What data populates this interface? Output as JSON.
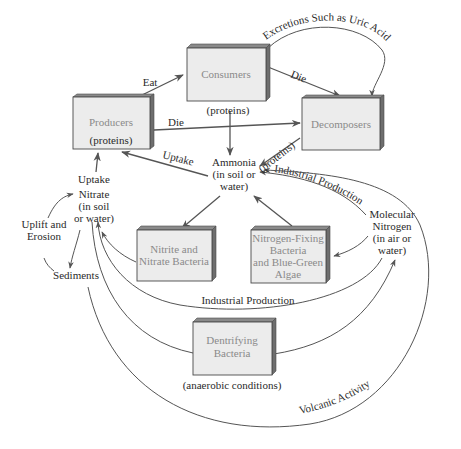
{
  "diagram": {
    "nodes": {
      "producers": {
        "label": "Producers",
        "sublabel": "(proteins)"
      },
      "consumers": {
        "label": "Consumers",
        "sublabel": "(proteins)"
      },
      "decomposers": {
        "label": "Decomposers"
      },
      "nitrite_bacteria": {
        "line1": "Nitrite and",
        "line2": "Nitrate Bacteria"
      },
      "nitrogen_fixing": {
        "line1": "Nitrogen-Fixing",
        "line2": "Bacteria",
        "line3": "and Blue-Green",
        "line4": "Algae"
      },
      "dentrifying": {
        "line1": "Dentrifying",
        "line2": "Bacteria",
        "sublabel": "(anaerobic conditions)"
      },
      "ammonia": {
        "line1": "Ammonia",
        "line2": "(in soil or",
        "line3": "water)"
      },
      "nitrate": {
        "line0": "Uptake",
        "line1": "Nitrate",
        "line2": "(in soil",
        "line3": "or water)"
      },
      "molecular_nitrogen": {
        "line1": "Molecular",
        "line2": "Nitrogen",
        "line3": "(in air or",
        "line4": "water)"
      },
      "sediments": {
        "label": "Sediments"
      },
      "uplift": {
        "line1": "Uplift and",
        "line2": "Erosion"
      }
    },
    "edges": {
      "eat": "Eat",
      "die_producers": "Die",
      "die_consumers": "Die",
      "excretions": "Excretions Such as Uric Acid",
      "uptake_ammonia": "Uptake",
      "proteins_decomposers": "(proteins)",
      "industrial_production_top": "Industrial Production",
      "industrial_production_bottom": "Industrial Production",
      "volcanic_activity": "Volcanic Activity"
    },
    "colors": {
      "box_face": "#ececec",
      "box_edge": "#6e6e6e",
      "box_text": "#8a8a8a",
      "line": "#555555",
      "label_text": "#2a2a2a"
    }
  }
}
